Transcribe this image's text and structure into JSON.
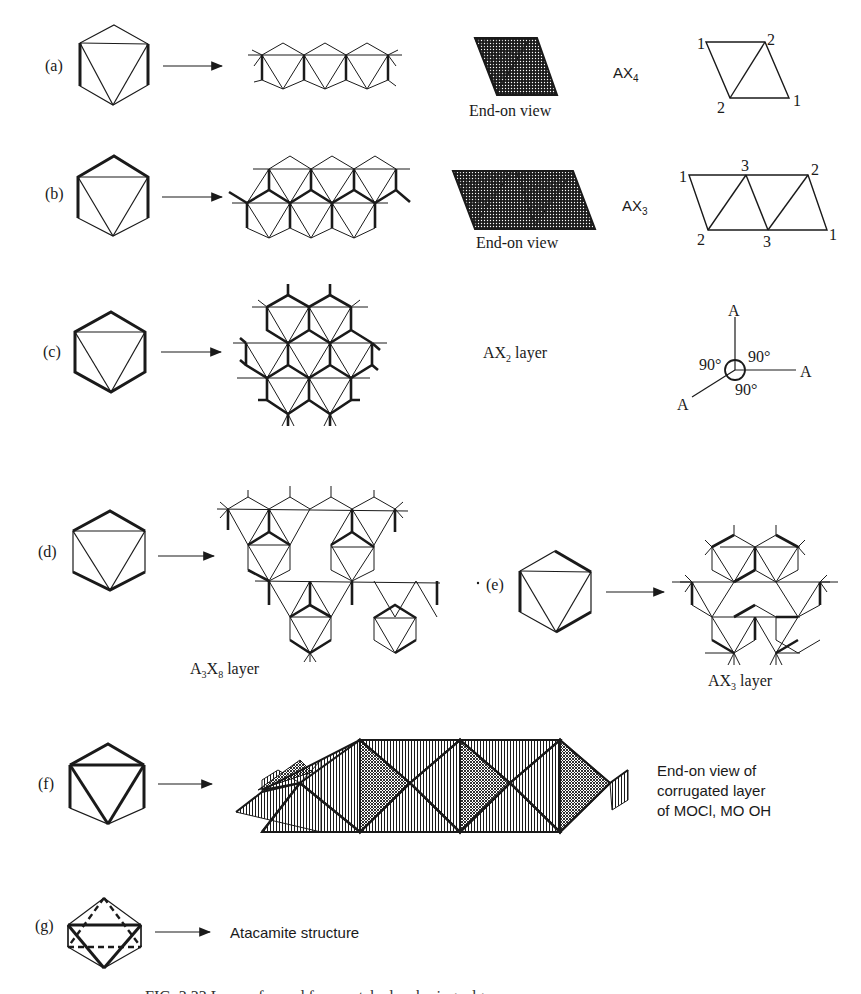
{
  "figure": {
    "panels": [
      {
        "id": "a",
        "label": "(a)",
        "end_on_caption": "End-on view",
        "formula": "AX",
        "formula_sub": "4",
        "vertex_labels": [
          "1",
          "2",
          "2",
          "1"
        ]
      },
      {
        "id": "b",
        "label": "(b)",
        "end_on_caption": "End-on view",
        "formula": "AX",
        "formula_sub": "3",
        "vertex_labels": [
          "1",
          "3",
          "2",
          "2",
          "3",
          "1"
        ]
      },
      {
        "id": "c",
        "label": "(c)",
        "layer_caption": "AX",
        "layer_sub": "2",
        "layer_suffix": " layer",
        "angle_labels": [
          "90°",
          "90°",
          "90°"
        ],
        "atom_labels": [
          "A",
          "A",
          "A"
        ]
      },
      {
        "id": "d",
        "label": "(d)",
        "layer_caption_a": "A",
        "layer_sub_a": "3",
        "layer_caption_x": "X",
        "layer_sub_x": "8",
        "layer_suffix": " layer"
      },
      {
        "id": "e",
        "label": "(e)",
        "layer_caption": "AX",
        "layer_sub": "3",
        "layer_suffix": " layer"
      },
      {
        "id": "f",
        "label": "(f)",
        "description_lines": [
          "End-on view of",
          "corrugated layer",
          "of MOCl, MO OH"
        ]
      },
      {
        "id": "g",
        "label": "(g)",
        "result": "Atacamite structure"
      }
    ],
    "caption": "FIG. 3.33  Layers formed from octahedra sharing edges."
  },
  "colors": {
    "ink": "#1a1a1a",
    "paper": "#ffffff"
  }
}
